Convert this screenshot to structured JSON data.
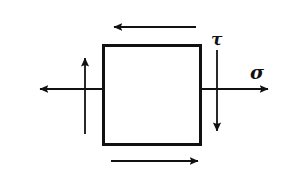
{
  "figure": {
    "background_color": "#ffffff",
    "stroke_color": "#111111"
  },
  "element_box": {
    "name": "stress-element-square",
    "x": 102,
    "y": 44,
    "width": 100,
    "height": 102,
    "border_width": 3,
    "fill": "#ffffff"
  },
  "labels": {
    "sigma": {
      "text": "σ",
      "icon_name": "sigma-symbol",
      "x": 256,
      "y": 79
    },
    "tau": {
      "text": "τ",
      "icon_name": "tau-symbol",
      "x": 216,
      "y": 45
    }
  },
  "arrows": [
    {
      "name": "shear-arrow-top",
      "direction": "left",
      "orientation": "horizontal",
      "x1": 196,
      "y1": 27,
      "x2": 112,
      "y2": 27
    },
    {
      "name": "shear-arrow-bottom",
      "direction": "right",
      "orientation": "horizontal",
      "x1": 111,
      "y1": 161,
      "x2": 200,
      "y2": 161
    },
    {
      "name": "normal-arrow-left",
      "direction": "left",
      "orientation": "horizontal",
      "x1": 103,
      "y1": 89,
      "x2": 38,
      "y2": 89
    },
    {
      "name": "normal-arrow-right-sigma",
      "direction": "right",
      "orientation": "horizontal",
      "x1": 201,
      "y1": 89,
      "x2": 270,
      "y2": 89
    },
    {
      "name": "shear-arrow-left-up",
      "direction": "up",
      "orientation": "vertical",
      "x1": 85,
      "y1": 134,
      "x2": 85,
      "y2": 56
    },
    {
      "name": "shear-arrow-right-down-tau",
      "direction": "down",
      "orientation": "vertical",
      "x1": 217,
      "y1": 50,
      "x2": 217,
      "y2": 133
    }
  ]
}
